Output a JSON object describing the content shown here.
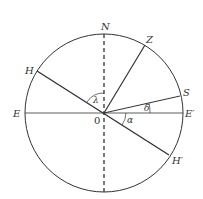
{
  "diagram": {
    "type": "celestial-sphere-projection",
    "colors": {
      "line": "#333333",
      "background": "#ffffff"
    },
    "circle": {
      "cx": 104,
      "cy": 113,
      "r": 79
    },
    "labels": {
      "north": "N",
      "zenith": "Z",
      "horizon_left": "H",
      "star": "S",
      "east": "E",
      "east_prime": "E′",
      "horizon_right": "H′",
      "origin": "0",
      "lambda": "λ",
      "delta": "δ",
      "alpha": "α"
    },
    "lines": [
      {
        "name": "vertical-axis",
        "style": "dashed",
        "from": "N",
        "to": "bottom"
      },
      {
        "name": "horizontal-axis",
        "style": "solid",
        "from": "E",
        "to": "E′"
      },
      {
        "name": "horizon-line",
        "style": "solid",
        "from": "H",
        "to": "H′"
      },
      {
        "name": "zenith-line",
        "style": "solid",
        "from": "0",
        "to": "Z"
      },
      {
        "name": "star-line",
        "style": "solid",
        "from": "0",
        "to": "S"
      }
    ],
    "angles": [
      {
        "symbol": "λ",
        "between": [
          "ON",
          "OH"
        ]
      },
      {
        "symbol": "δ",
        "between": [
          "OE′",
          "OS"
        ]
      },
      {
        "symbol": "α",
        "between": [
          "OE′",
          "OH′"
        ]
      }
    ]
  }
}
